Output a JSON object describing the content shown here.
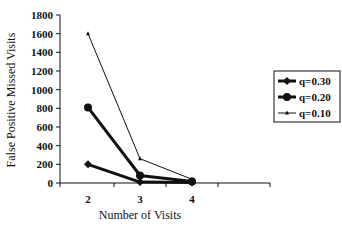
{
  "chart_data": {
    "type": "line",
    "title": "",
    "xlabel": "Number of Visits",
    "ylabel": "False Positive Missed Visits",
    "x": [
      2,
      3,
      4
    ],
    "x_tick_labels": [
      "2",
      "3",
      "4"
    ],
    "y_tick_labels": [
      "0",
      "200",
      "400",
      "600",
      "800",
      "1000",
      "1200",
      "1400",
      "1600",
      "1800"
    ],
    "ylim": [
      0,
      1800
    ],
    "grid": false,
    "legend_position": "right",
    "series": [
      {
        "name": "q=0.30",
        "values": [
          200,
          10,
          5
        ],
        "marker": "diamond",
        "line_width": 3
      },
      {
        "name": "q=0.20",
        "values": [
          810,
          80,
          15
        ],
        "marker": "circle",
        "line_width": 3
      },
      {
        "name": "q=0.10",
        "values": [
          1600,
          260,
          40
        ],
        "marker": "triangle",
        "line_width": 1
      }
    ]
  }
}
